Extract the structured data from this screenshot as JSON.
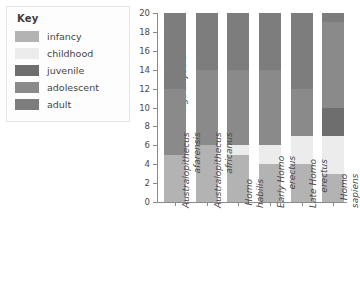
{
  "legend": {
    "title": "Key",
    "items": [
      {
        "label": "infancy",
        "color": "#b3b3b3"
      },
      {
        "label": "childhood",
        "color": "#ececec"
      },
      {
        "label": "juvenile",
        "color": "#6e6e6e"
      },
      {
        "label": "adolescent",
        "color": "#8a8a8a"
      },
      {
        "label": "adult",
        "color": "#7d7d7d"
      }
    ]
  },
  "axis": {
    "ylabel": "Age in years",
    "yticks": [
      "0",
      "2",
      "4",
      "6",
      "8",
      "10",
      "12",
      "14",
      "16",
      "18",
      "20"
    ]
  },
  "chart_data": {
    "type": "bar",
    "stacked": true,
    "title": "",
    "xlabel": "",
    "ylabel": "Age in years",
    "ylim": [
      0,
      20
    ],
    "ytick_step": 2,
    "grid": false,
    "legend_position": "top-left",
    "categories": [
      "Australopithecus\nafarensis",
      "Australopithecus\nafricanus",
      "Homo\nhabilis",
      "Early Homo\nerectus",
      "Late Homo\nerectus",
      "Homo\nsapiens"
    ],
    "series": [
      {
        "name": "infancy",
        "color": "#b3b3b3",
        "values": [
          5,
          6,
          5,
          4,
          4,
          3
        ]
      },
      {
        "name": "childhood",
        "color": "#ececec",
        "values": [
          0,
          0,
          1,
          2,
          3,
          4
        ]
      },
      {
        "name": "juvenile",
        "color": "#6e6e6e",
        "values": [
          0,
          0,
          0,
          0,
          0,
          3
        ]
      },
      {
        "name": "adolescent",
        "color": "#8a8a8a",
        "values": [
          7,
          8,
          8,
          8,
          5,
          9
        ]
      },
      {
        "name": "adult",
        "color": "#7d7d7d",
        "values": [
          8,
          6,
          6,
          6,
          8,
          1
        ]
      }
    ],
    "segment_boundaries": [
      {
        "category": "Australopithecus afarensis",
        "infancy": [
          0,
          5
        ],
        "adolescent": [
          5,
          12
        ],
        "adult": [
          12,
          20
        ]
      },
      {
        "category": "Australopithecus africanus",
        "infancy": [
          0,
          6
        ],
        "adolescent": [
          6,
          14
        ],
        "adult": [
          14,
          20
        ]
      },
      {
        "category": "Homo habilis",
        "infancy": [
          0,
          5
        ],
        "childhood": [
          5,
          6
        ],
        "adolescent": [
          6,
          14
        ],
        "adult": [
          14,
          20
        ]
      },
      {
        "category": "Early Homo erectus",
        "infancy": [
          0,
          4
        ],
        "childhood": [
          4,
          6
        ],
        "adolescent": [
          6,
          14
        ],
        "adult": [
          14,
          20
        ]
      },
      {
        "category": "Late Homo erectus",
        "infancy": [
          0,
          4
        ],
        "childhood": [
          4,
          7
        ],
        "adolescent": [
          7,
          12
        ],
        "adult": [
          12,
          20
        ]
      },
      {
        "category": "Homo sapiens",
        "infancy": [
          0,
          3
        ],
        "childhood": [
          3,
          7
        ],
        "juvenile": [
          7,
          10
        ],
        "adolescent": [
          10,
          19
        ],
        "adult": [
          19,
          20
        ]
      }
    ]
  }
}
